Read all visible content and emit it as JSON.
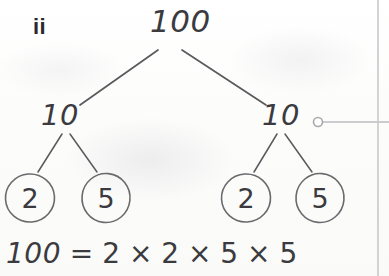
{
  "page": {
    "width": 389,
    "height": 276,
    "background_color": "#fdfdfc",
    "ink_color": "#3b3b3f",
    "rule_color": "#c9c9cc"
  },
  "part_label": {
    "text": "ii"
  },
  "factor_tree": {
    "root": {
      "value": "100",
      "x": 168,
      "y": 22
    },
    "level2": [
      {
        "value": "10",
        "x": 62,
        "y": 117,
        "side": "left"
      },
      {
        "value": "10",
        "x": 283,
        "y": 117,
        "side": "right"
      }
    ],
    "leaves": [
      {
        "value": "2",
        "cx": 30,
        "cy": 198,
        "r": 24,
        "side": "left-outer"
      },
      {
        "value": "5",
        "cx": 106,
        "cy": 198,
        "r": 24,
        "side": "left-inner"
      },
      {
        "value": "2",
        "cx": 246,
        "cy": 198,
        "r": 24,
        "side": "right-inner"
      },
      {
        "value": "5",
        "cx": 320,
        "cy": 198,
        "r": 24,
        "side": "right-outer"
      }
    ],
    "branches": [
      {
        "from": "root",
        "to": "left-10",
        "x1": 158,
        "y1": 50,
        "x2": 80,
        "y2": 105
      },
      {
        "from": "root",
        "to": "right-10",
        "x1": 182,
        "y1": 50,
        "x2": 266,
        "y2": 105
      },
      {
        "from": "left-10",
        "to": "leaf-2",
        "x1": 62,
        "y1": 134,
        "x2": 38,
        "y2": 172
      },
      {
        "from": "left-10",
        "to": "leaf-5",
        "x1": 70,
        "y1": 134,
        "x2": 97,
        "y2": 172
      },
      {
        "from": "right-10",
        "to": "leaf-2",
        "x1": 277,
        "y1": 134,
        "x2": 254,
        "y2": 172
      },
      {
        "from": "right-10",
        "to": "leaf-5",
        "x1": 285,
        "y1": 134,
        "x2": 312,
        "y2": 172
      }
    ]
  },
  "callout": {
    "anchor_dot": {
      "cx": 318,
      "cy": 122,
      "r": 4.5
    },
    "leader_line": {
      "x1": 323,
      "y1": 122,
      "x2": 389,
      "y2": 122
    }
  },
  "margin_rule": {
    "x": 378,
    "y1": 0,
    "y2": 276
  },
  "equation": {
    "left": "100",
    "relation": " = ",
    "right": "2 × 2 × 5 × 5",
    "full_text": "100 = 2 × 2 × 5 × 5"
  }
}
